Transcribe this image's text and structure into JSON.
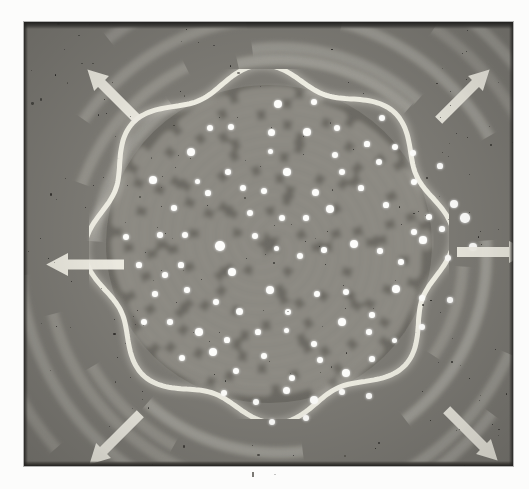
{
  "figure": {
    "kind": "photograph",
    "description": "Grayscale halftone photograph of a rotating spiral-arm pattern with a scalloped bright rim and scattered bright point markers",
    "caption": "",
    "plate": {
      "x": 24,
      "y": 22,
      "width": 489,
      "height": 444
    },
    "colors": {
      "paper": "#fcfcfb",
      "outer_field": "#77756f",
      "outer_streak": "#a8a69e",
      "inner_disc": "#67655f",
      "inner_arm": "#8c8a83",
      "bright_rim": "#f2f0e6",
      "dot": "#fdfdfb",
      "arrow": "#f0eee4",
      "plate_edge": "#232220"
    }
  },
  "arrows": [
    {
      "name": "arrow-northwest",
      "label": "outward flow NW",
      "cx": 88,
      "cy": 72,
      "angle": -135,
      "length": 52,
      "head": 21
    },
    {
      "name": "arrow-northeast",
      "label": "outward flow NE",
      "cx": 440,
      "cy": 72,
      "angle": -45,
      "length": 52,
      "head": 21
    },
    {
      "name": "arrow-west",
      "label": "outward flow W",
      "cx": 60,
      "cy": 242,
      "angle": 180,
      "length": 56,
      "head": 23
    },
    {
      "name": "arrow-east",
      "label": "outward flow E",
      "cx": 470,
      "cy": 230,
      "angle": 0,
      "length": 52,
      "head": 22
    },
    {
      "name": "arrow-southwest",
      "label": "outward flow SW",
      "cx": 90,
      "cy": 417,
      "angle": 135,
      "length": 52,
      "head": 21
    },
    {
      "name": "arrow-southeast",
      "label": "outward flow SE",
      "cx": 448,
      "cy": 413,
      "angle": 45,
      "length": 52,
      "head": 21
    }
  ],
  "chart_data": {
    "type": "scatter",
    "title": "",
    "xlabel": "",
    "ylabel": "",
    "xlim": [
      0,
      489
    ],
    "ylim": [
      0,
      444
    ],
    "grid": false,
    "legend": null,
    "series": [
      {
        "name": "bright-markers",
        "color": "#fdfdfb",
        "points": [
          [
            254,
            82
          ],
          [
            290,
            80
          ],
          [
            186,
            106
          ],
          [
            207,
            105
          ],
          [
            247,
            110
          ],
          [
            283,
            110
          ],
          [
            313,
            106
          ],
          [
            343,
            122
          ],
          [
            371,
            125
          ],
          [
            358,
            96
          ],
          [
            167,
            130
          ],
          [
            247,
            130
          ],
          [
            311,
            133
          ],
          [
            355,
            140
          ],
          [
            389,
            131
          ],
          [
            129,
            158
          ],
          [
            150,
            186
          ],
          [
            173,
            159
          ],
          [
            204,
            150
          ],
          [
            226,
            191
          ],
          [
            263,
            150
          ],
          [
            291,
            170
          ],
          [
            318,
            150
          ],
          [
            390,
            160
          ],
          [
            416,
            144
          ],
          [
            430,
            182
          ],
          [
            405,
            195
          ],
          [
            136,
            213
          ],
          [
            161,
            213
          ],
          [
            184,
            171
          ],
          [
            196,
            224
          ],
          [
            219,
            166
          ],
          [
            240,
            169
          ],
          [
            258,
            196
          ],
          [
            282,
            196
          ],
          [
            306,
            187
          ],
          [
            337,
            166
          ],
          [
            362,
            183
          ],
          [
            390,
            210
          ],
          [
            418,
            207
          ],
          [
            441,
            196
          ],
          [
            102,
            215
          ],
          [
            115,
            243
          ],
          [
            141,
            253
          ],
          [
            157,
            243
          ],
          [
            208,
            250
          ],
          [
            231,
            214
          ],
          [
            252,
            226
          ],
          [
            276,
            234
          ],
          [
            300,
            228
          ],
          [
            330,
            222
          ],
          [
            356,
            229
          ],
          [
            377,
            240
          ],
          [
            399,
            218
          ],
          [
            424,
            236
          ],
          [
            449,
            225
          ],
          [
            131,
            272
          ],
          [
            163,
            268
          ],
          [
            192,
            280
          ],
          [
            215,
            289
          ],
          [
            246,
            268
          ],
          [
            264,
            290
          ],
          [
            293,
            272
          ],
          [
            322,
            270
          ],
          [
            348,
            293
          ],
          [
            372,
            267
          ],
          [
            398,
            276
          ],
          [
            426,
            278
          ],
          [
            120,
            300
          ],
          [
            146,
            300
          ],
          [
            175,
            310
          ],
          [
            203,
            318
          ],
          [
            234,
            310
          ],
          [
            262,
            308
          ],
          [
            290,
            322
          ],
          [
            318,
            300
          ],
          [
            345,
            310
          ],
          [
            370,
            318
          ],
          [
            398,
            305
          ],
          [
            158,
            336
          ],
          [
            189,
            330
          ],
          [
            212,
            349
          ],
          [
            240,
            334
          ],
          [
            268,
            356
          ],
          [
            296,
            338
          ],
          [
            322,
            351
          ],
          [
            348,
            337
          ],
          [
            200,
            371
          ],
          [
            232,
            380
          ],
          [
            262,
            368
          ],
          [
            290,
            378
          ],
          [
            318,
            370
          ],
          [
            345,
            374
          ],
          [
            248,
            400
          ],
          [
            282,
            396
          ]
        ]
      }
    ]
  },
  "spiral": {
    "inner_disc": {
      "cx": 244,
      "cy": 222,
      "rx": 165,
      "ry": 161,
      "arm_count": 5,
      "turns": 2.6
    },
    "bright_rim": {
      "cx": 244,
      "cy": 222,
      "rx": 180,
      "ry": 175,
      "lobes": 8,
      "lobe_depth": 11,
      "stroke": 5
    },
    "outer_streaks": {
      "count": 26,
      "curvature": "clockwise",
      "band_width": 11
    }
  }
}
